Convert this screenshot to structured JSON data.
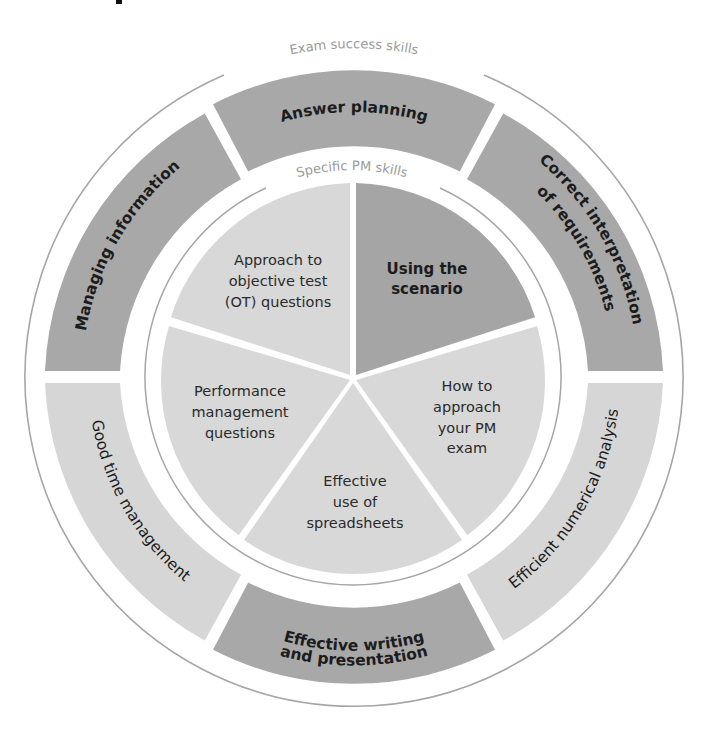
{
  "title_fragment": "p",
  "colors": {
    "background": "#ffffff",
    "dark_segment": "#a8a8a8",
    "light_segment": "#d8d8d8",
    "ring_line": "#a0a0a0",
    "ring_label": "#9a9a9a",
    "text": "#1c1c1c"
  },
  "outer_ring": {
    "label": "Exam success skills",
    "segments": [
      {
        "label": "Answer planning",
        "shade": "dark"
      },
      {
        "label": "Correct interpretation of requirements",
        "lines": [
          "Correct interpretation",
          "of requirements"
        ],
        "shade": "dark"
      },
      {
        "label": "Efficient numerical analysis",
        "shade": "light"
      },
      {
        "label": "Effective writing and presentation",
        "lines": [
          "Effective writing",
          "and presentation"
        ],
        "shade": "dark"
      },
      {
        "label": "Good time management",
        "shade": "light"
      },
      {
        "label": "Managing information",
        "shade": "dark"
      }
    ]
  },
  "inner_ring": {
    "label": "Specific PM skills",
    "slices": [
      {
        "label": "Using the scenario",
        "lines": [
          "Using the",
          "scenario"
        ],
        "shade": "dark"
      },
      {
        "label": "How to approach your PM exam",
        "lines": [
          "How to",
          "approach",
          "your PM",
          "exam"
        ],
        "shade": "light"
      },
      {
        "label": "Effective use of spreadsheets",
        "lines": [
          "Effective",
          "use of",
          "spreadsheets"
        ],
        "shade": "light"
      },
      {
        "label": "Performance management questions",
        "lines": [
          "Performance",
          "management",
          "questions"
        ],
        "shade": "light"
      },
      {
        "label": "Approach to objective test (OT) questions",
        "lines": [
          "Approach to",
          "objective test",
          "(OT) questions"
        ],
        "shade": "light"
      }
    ]
  }
}
